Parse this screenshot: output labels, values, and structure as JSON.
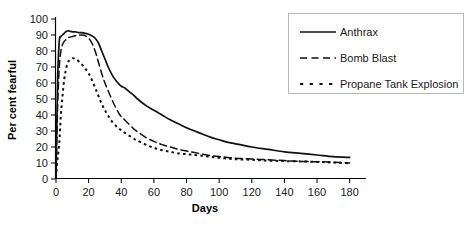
{
  "chart_data": {
    "type": "line",
    "title": "",
    "xlabel": "Days",
    "ylabel": "Per cent fearful",
    "xlim": [
      0,
      190
    ],
    "ylim": [
      0,
      100
    ],
    "grid": false,
    "legend_position": "top-right",
    "xticks": [
      0,
      20,
      40,
      60,
      80,
      100,
      120,
      140,
      160,
      180
    ],
    "yticks": [
      0,
      10,
      20,
      30,
      40,
      50,
      60,
      70,
      80,
      90,
      100
    ],
    "x": [
      0,
      1,
      2,
      3,
      4,
      5,
      6,
      7,
      8,
      10,
      12,
      14,
      16,
      18,
      20,
      22,
      24,
      26,
      28,
      30,
      32,
      35,
      38,
      40,
      42,
      45,
      48,
      50,
      55,
      60,
      65,
      70,
      75,
      80,
      85,
      90,
      95,
      100,
      105,
      110,
      120,
      130,
      140,
      150,
      160,
      170,
      180
    ],
    "series": [
      {
        "name": "Anthrax",
        "style": "solid",
        "values": [
          1,
          62,
          86,
          89,
          90,
          91,
          92,
          92.5,
          92.5,
          92,
          92,
          91.5,
          91.5,
          91,
          90.5,
          89.5,
          88,
          85,
          80,
          75,
          70,
          64,
          60,
          58,
          57,
          54.5,
          52,
          50,
          46,
          43,
          40,
          37,
          34.5,
          32,
          30,
          28,
          26,
          24.5,
          23,
          22,
          20,
          18.5,
          17,
          16,
          15,
          14,
          13.5
        ]
      },
      {
        "name": "Bomb Blast",
        "style": "dashed",
        "values": [
          1,
          45,
          70,
          80,
          84,
          86,
          87,
          88,
          88.5,
          89,
          89.5,
          90,
          90,
          89.5,
          88,
          85,
          80,
          73,
          66,
          60,
          55,
          48,
          42,
          39,
          37,
          34,
          31,
          29.5,
          26,
          23.5,
          21.5,
          20,
          18.5,
          17.5,
          16.5,
          15.5,
          14.5,
          14,
          13.5,
          13,
          12.5,
          12,
          11.5,
          11,
          10.8,
          10.5,
          10
        ]
      },
      {
        "name": "Propane Tank Explosion",
        "style": "dotted",
        "values": [
          1,
          13,
          22,
          40,
          52,
          62,
          68,
          72,
          74,
          75.5,
          75,
          73.5,
          71.5,
          69,
          66,
          62,
          57,
          52,
          47,
          43,
          39.5,
          35,
          32,
          30.5,
          29,
          27,
          25,
          24,
          21.5,
          19.5,
          18,
          17,
          16,
          15.5,
          15,
          14.5,
          13.8,
          13.2,
          12.8,
          12.4,
          12,
          11.5,
          11.2,
          11,
          10.7,
          10.3,
          9.8
        ]
      }
    ]
  },
  "legend": {
    "entries": [
      {
        "label": "Anthrax",
        "style": "solid"
      },
      {
        "label": "Bomb Blast",
        "style": "dashed"
      },
      {
        "label": "Propane Tank Explosion",
        "style": "dotted"
      }
    ]
  },
  "colors": {
    "line": "#111111",
    "axis": "#000000",
    "legend_border": "#b9b9b9",
    "background": "#ffffff"
  }
}
